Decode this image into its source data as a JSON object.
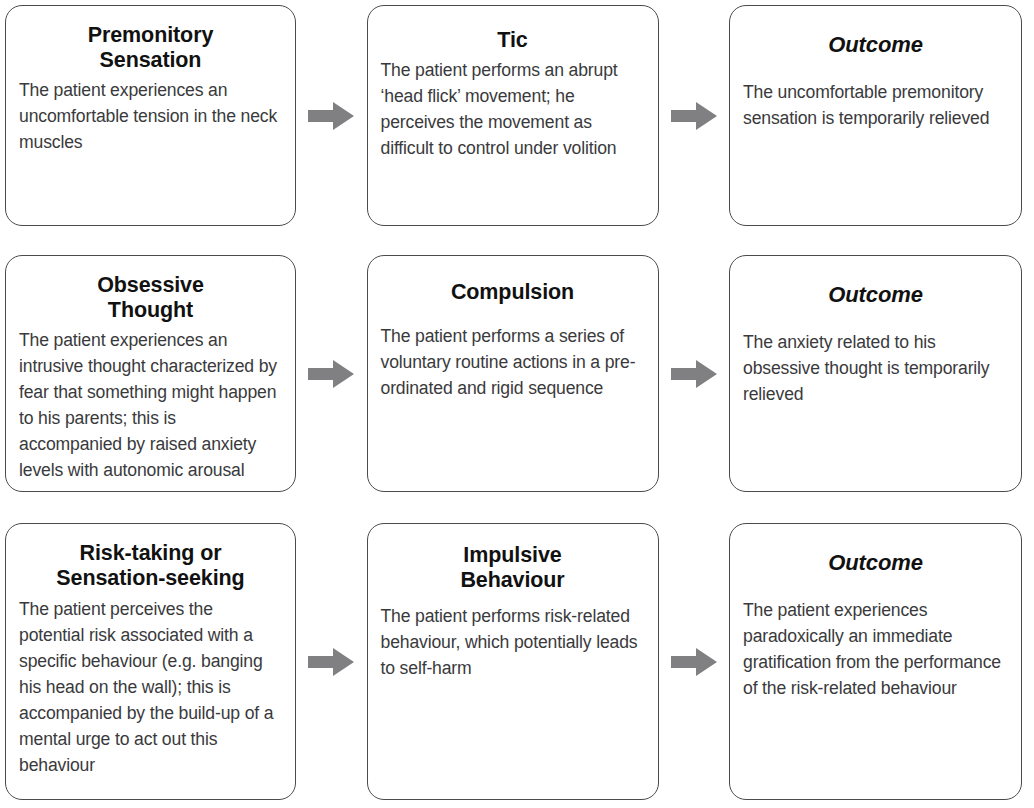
{
  "figure": {
    "kind": "three-stage flow diagram",
    "arrow_color": "#808083",
    "box_border_color": "#4b4b4d",
    "title_color": "#111111",
    "body_color": "#3a3a3c",
    "background_color": "#ffffff"
  },
  "icons": {
    "arrow_right": "arrow-right-icon"
  },
  "rows": [
    {
      "id": "row-tic",
      "cells": [
        {
          "id": "premonitory-sensation",
          "title": "Premonitory\nSensation",
          "title_style": "bold",
          "body": "The patient experiences an uncomfortable tension in the neck muscles"
        },
        {
          "id": "tic",
          "title": "Tic",
          "title_style": "bold",
          "body": "The patient performs an abrupt ‘head flick’ movement; he perceives the movement as difficult to control under volition"
        },
        {
          "id": "outcome-tic",
          "title": "Outcome",
          "title_style": "bold-italic",
          "body": "The uncomfortable premonitory sensation is temporarily relieved"
        }
      ]
    },
    {
      "id": "row-compulsion",
      "cells": [
        {
          "id": "obsessive-thought",
          "title": "Obsessive\nThought",
          "title_style": "bold",
          "body": "The patient experiences an intrusive thought characterized by fear that something might happen to his parents; this is accompanied by raised anxiety levels with autonomic arousal"
        },
        {
          "id": "compulsion",
          "title": "Compulsion",
          "title_style": "bold",
          "body": "The patient performs a series of voluntary routine actions in a pre-ordinated and rigid sequence"
        },
        {
          "id": "outcome-compulsion",
          "title": "Outcome",
          "title_style": "bold-italic",
          "body": "The anxiety related to his obsessive thought is temporarily relieved"
        }
      ]
    },
    {
      "id": "row-impulsive",
      "cells": [
        {
          "id": "risk-taking-or-sensation-seeking",
          "title": "Risk-taking or\nSensation-seeking",
          "title_style": "bold",
          "body": "The patient perceives the potential risk associated with a specific behaviour (e.g. banging his head on the wall); this is accompanied by the build-up of a mental urge to act out this behaviour"
        },
        {
          "id": "impulsive-behaviour",
          "title": "Impulsive\nBehaviour",
          "title_style": "bold",
          "body": "The patient performs risk-related behaviour, which potentially leads to self-harm"
        },
        {
          "id": "outcome-impulsive",
          "title": "Outcome",
          "title_style": "bold-italic",
          "body": "The patient experiences paradoxically an immediate gratification from the performance of the risk-related behaviour"
        }
      ]
    }
  ]
}
